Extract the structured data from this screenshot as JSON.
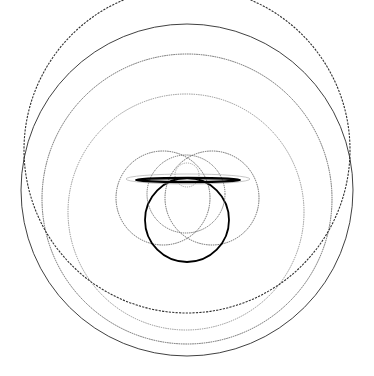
{
  "figure": {
    "background_color": "#ffffff",
    "width": 374,
    "height": 376,
    "ink_color": "#000000",
    "faint_ink_color": "#8a8a8a",
    "mid_ink_color": "#5a5a5a"
  },
  "chart_data": {
    "type": "scatter",
    "subtitle": "",
    "xlabel": "",
    "ylabel": "",
    "xlim": [
      0,
      374
    ],
    "ylim": [
      0,
      376
    ],
    "grid": false,
    "legend": "none",
    "annotations": [],
    "tick_labels": {
      "x": [],
      "y": []
    },
    "shapes": [
      {
        "name": "outer-boundary-circle",
        "kind": "circle",
        "cx": 187,
        "cy": 190,
        "r": 166,
        "stroke": "#2b2b2b",
        "stroke_width": 0.9,
        "opacity": 1,
        "dash": "none"
      },
      {
        "name": "second-ring-circle",
        "kind": "circle",
        "cx": 187,
        "cy": 199,
        "r": 145,
        "stroke": "#555555",
        "stroke_width": 0.9,
        "opacity": 0.95,
        "dash": "1.6 0.7"
      },
      {
        "name": "third-ring-circle",
        "kind": "circle",
        "cx": 186,
        "cy": 212,
        "r": 118,
        "stroke": "#6b6b6b",
        "stroke_width": 0.85,
        "opacity": 0.85,
        "dash": "1.4 0.9"
      },
      {
        "name": "lower-heavy-arc",
        "kind": "circle",
        "cx": 187,
        "cy": 150,
        "r": 163,
        "stroke": "#1a1a1a",
        "stroke_width": 1.1,
        "opacity": 0.9,
        "dash": "2.2 1.2"
      },
      {
        "name": "left-lobe-circle",
        "kind": "circle",
        "cx": 163,
        "cy": 198,
        "r": 47,
        "stroke": "#4a4a4a",
        "stroke_width": 0.9,
        "opacity": 0.9,
        "dash": "1.5 0.8"
      },
      {
        "name": "right-lobe-circle",
        "kind": "circle",
        "cx": 212,
        "cy": 198,
        "r": 47,
        "stroke": "#4a4a4a",
        "stroke_width": 0.9,
        "opacity": 0.9,
        "dash": "1.5 0.8"
      },
      {
        "name": "bold-main-circle",
        "cx": 187,
        "kind": "circle",
        "cy": 220,
        "r": 42,
        "stroke": "#000000",
        "stroke_width": 1.8,
        "opacity": 1,
        "dash": "none"
      },
      {
        "name": "inner-gray-circle",
        "kind": "circle",
        "cx": 186,
        "cy": 194,
        "r": 39,
        "stroke": "#5f5f5f",
        "stroke_width": 1.0,
        "opacity": 0.9,
        "dash": "1.3 0.8"
      },
      {
        "name": "small-top-lens-circle",
        "kind": "circle",
        "cx": 187,
        "cy": 175,
        "r": 12,
        "stroke": "#7a7a7a",
        "stroke_width": 0.85,
        "opacity": 0.8,
        "dash": "1.2 1.0"
      },
      {
        "name": "flat-horizontal-ellipse",
        "kind": "ellipse",
        "cx": 188,
        "cy": 180,
        "rx": 52,
        "ry": 2.0,
        "stroke": "#000000",
        "stroke_width": 2.4,
        "opacity": 1,
        "dash": "none"
      },
      {
        "name": "flat-horizontal-whisker",
        "kind": "ellipse",
        "cx": 188,
        "cy": 179,
        "rx": 62,
        "ry": 5.0,
        "stroke": "#9a9a9a",
        "stroke_width": 0.8,
        "opacity": 0.7,
        "dash": "none"
      }
    ]
  }
}
